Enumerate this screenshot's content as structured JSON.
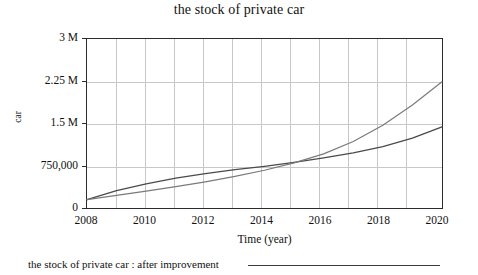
{
  "chart_data": {
    "type": "line",
    "title": "the stock of private car",
    "xlabel": "Time (year)",
    "ylabel": "car",
    "xlim": [
      2008,
      2020
    ],
    "ylim": [
      0,
      3000000
    ],
    "grid": true,
    "legend_position": "bottom-left",
    "xticks": [
      "2008",
      "2010",
      "2012",
      "2014",
      "2016",
      "2018",
      "2020"
    ],
    "xtick_values": [
      2008,
      2010,
      2012,
      2014,
      2016,
      2018,
      2020
    ],
    "yticks": [
      "0",
      "750,000",
      "1.5 M",
      "2.25 M",
      "3 M"
    ],
    "ytick_values": [
      0,
      750000,
      1500000,
      2250000,
      3000000
    ],
    "x": [
      2008,
      2009,
      2010,
      2011,
      2012,
      2013,
      2014,
      2015,
      2016,
      2017,
      2018,
      2019,
      2020
    ],
    "series": [
      {
        "name": "the stock of private car : after improvement",
        "color": "#4a4a4a",
        "values": [
          150000,
          310000,
          430000,
          530000,
          610000,
          680000,
          740000,
          810000,
          890000,
          980000,
          1090000,
          1240000,
          1440000
        ]
      },
      {
        "name": "the stock of private car",
        "color": "#7a7a7a",
        "values": [
          150000,
          225000,
          300000,
          380000,
          465000,
          560000,
          670000,
          800000,
          960000,
          1180000,
          1470000,
          1830000,
          2240000
        ]
      }
    ]
  },
  "legend": {
    "label": "the stock of private car : after improvement"
  }
}
